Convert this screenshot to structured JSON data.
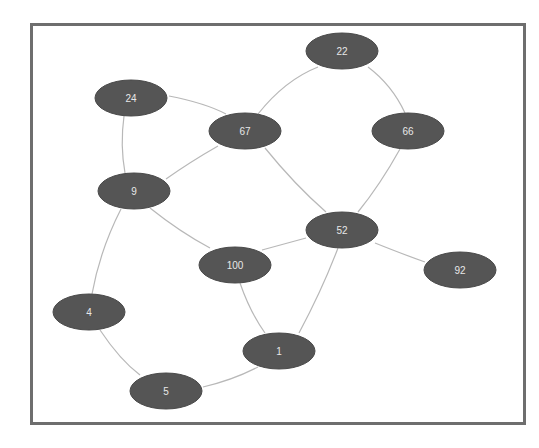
{
  "graph": {
    "colors": {
      "node_fill": "#555555",
      "edge": "#b8b8b8",
      "frame": "#6e6e6e",
      "label": "#e8e8e8"
    },
    "nodes": [
      {
        "id": "22",
        "label": "22",
        "cx": 342,
        "cy": 51
      },
      {
        "id": "24",
        "label": "24",
        "cx": 131,
        "cy": 98
      },
      {
        "id": "67",
        "label": "67",
        "cx": 245,
        "cy": 131
      },
      {
        "id": "66",
        "label": "66",
        "cx": 408,
        "cy": 131
      },
      {
        "id": "9",
        "label": "9",
        "cx": 134,
        "cy": 191
      },
      {
        "id": "52",
        "label": "52",
        "cx": 342,
        "cy": 230
      },
      {
        "id": "100",
        "label": "100",
        "cx": 235,
        "cy": 265
      },
      {
        "id": "92",
        "label": "92",
        "cx": 460,
        "cy": 270
      },
      {
        "id": "4",
        "label": "4",
        "cx": 89,
        "cy": 312
      },
      {
        "id": "1",
        "label": "1",
        "cx": 279,
        "cy": 351
      },
      {
        "id": "5",
        "label": "5",
        "cx": 166,
        "cy": 391
      }
    ],
    "edges": [
      {
        "from": "24",
        "to": "67",
        "d": "M169,96 Q205,103 226,114"
      },
      {
        "from": "24",
        "to": "9",
        "d": "M124,116 Q120,145 125,173"
      },
      {
        "from": "67",
        "to": "22",
        "d": "M258,114 Q285,80 318,67"
      },
      {
        "from": "22",
        "to": "66",
        "d": "M368,67 Q392,85 405,113"
      },
      {
        "from": "67",
        "to": "9",
        "d": "M218,146 Q190,162 166,179"
      },
      {
        "from": "67",
        "to": "52",
        "d": "M265,148 Q295,185 326,212"
      },
      {
        "from": "66",
        "to": "52",
        "d": "M400,149 Q380,185 358,212"
      },
      {
        "from": "9",
        "to": "100",
        "d": "M150,208 Q180,232 210,248"
      },
      {
        "from": "9",
        "to": "4",
        "d": "M121,209 Q100,250 92,294"
      },
      {
        "from": "100",
        "to": "52",
        "d": "M262,250 Q288,243 306,238"
      },
      {
        "from": "52",
        "to": "92",
        "d": "M375,243 Q405,255 425,262"
      },
      {
        "from": "52",
        "to": "1",
        "d": "M338,248 Q322,290 299,333"
      },
      {
        "from": "100",
        "to": "1",
        "d": "M240,283 Q250,312 265,333"
      },
      {
        "from": "4",
        "to": "5",
        "d": "M100,330 Q120,360 140,375"
      },
      {
        "from": "5",
        "to": "1",
        "d": "M203,387 Q233,380 258,367"
      }
    ]
  }
}
